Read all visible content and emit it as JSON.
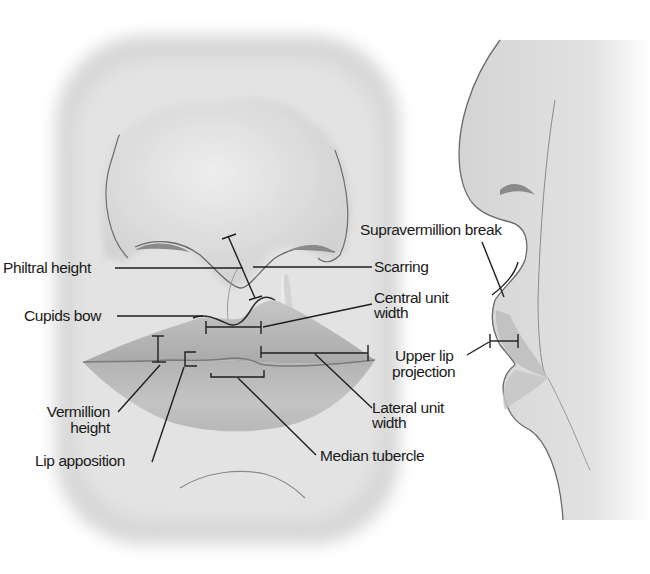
{
  "figure": {
    "views": [
      "frontal-view",
      "lateral-profile-view"
    ],
    "colors": {
      "background": "#ffffff",
      "skin_shade": "#d9d9d9",
      "lip_shade": "#b8b8b8",
      "line": "#2a2a2a",
      "text": "#1a1a1a"
    }
  },
  "labels": {
    "philtral_height": "Philtral height",
    "cupids_bow": "Cupids bow",
    "vermillion_height_line1": "Vermillion",
    "vermillion_height_line2": "height",
    "lip_apposition": "Lip apposition",
    "supravermillion_break": "Supravermillion break",
    "scarring": "Scarring",
    "central_unit_width_line1": "Central unit",
    "central_unit_width_line2": "width",
    "upper_lip_projection_line1": "Upper lip",
    "upper_lip_projection_line2": "projection",
    "lateral_unit_width_line1": "Lateral unit",
    "lateral_unit_width_line2": "width",
    "median_tubercle": "Median tubercle"
  }
}
